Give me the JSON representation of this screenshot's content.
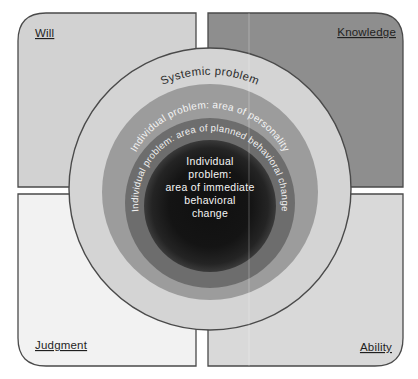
{
  "diagram": {
    "quadrants": [
      {
        "label": "Will",
        "position": "top-left",
        "color": "#d2d2d2"
      },
      {
        "label": "Knowledge",
        "position": "top-right",
        "color": "#8e8e8e"
      },
      {
        "label": "Judgment",
        "position": "bottom-left",
        "color": "#f2f2f2"
      },
      {
        "label": "Ability",
        "position": "bottom-right",
        "color": "#d9d9d9"
      }
    ],
    "rings": [
      {
        "label": "Systemic problem",
        "color": "#d4d4d4",
        "text_color": "#2d2d2d"
      },
      {
        "label": "Individual problem: area of personality",
        "color": "#9c9c9c",
        "text_color": "#f4f4f4"
      },
      {
        "label": "Individual problem: area of planned behavioral change",
        "color": "#6d6d6d",
        "text_color": "#f0f0f0"
      },
      {
        "label": "Individual problem: area of immediate behavioral change",
        "color": "#141414",
        "text_color": "#f5f5f5"
      }
    ],
    "center_text_lines": [
      "Individual",
      "problem:",
      "area of immediate",
      "behavioral",
      "change"
    ]
  }
}
